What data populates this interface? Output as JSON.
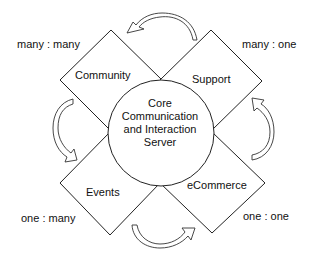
{
  "diagram": {
    "center": {
      "lines": [
        "Core",
        "Communication",
        "and Interaction",
        "Server"
      ]
    },
    "nodes": [
      {
        "id": "community",
        "label": "Community",
        "relation": "many : many"
      },
      {
        "id": "support",
        "label": "Support",
        "relation": "many : one"
      },
      {
        "id": "events",
        "label": "Events",
        "relation": "one : many"
      },
      {
        "id": "ecommerce",
        "label": "eCommerce",
        "relation": "one : one"
      }
    ],
    "arrows": [
      {
        "id": "top",
        "from": "support",
        "to": "community",
        "icon": "curved-arrow-icon"
      },
      {
        "id": "left",
        "from": "community",
        "to": "events",
        "icon": "curved-arrow-icon"
      },
      {
        "id": "bottom",
        "from": "events",
        "to": "ecommerce",
        "icon": "curved-arrow-icon"
      },
      {
        "id": "right",
        "from": "ecommerce",
        "to": "support",
        "icon": "curved-arrow-icon"
      }
    ],
    "colors": {
      "stroke": "#222222",
      "background": "#ffffff",
      "text": "#111111"
    }
  }
}
